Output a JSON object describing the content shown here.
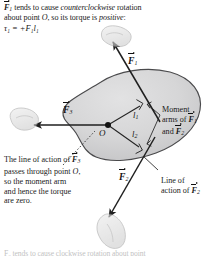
{
  "figure": {
    "caption_top": {
      "line1_a": "F",
      "line1_sub": "1",
      "line1_b": " tends to cause ",
      "line1_em": "counterclockwise",
      "line1_c": " rotation",
      "line2_a": "about point ",
      "line2_em": "O",
      "line2_b": ", so its torque is ",
      "line2_em2": "positive",
      "line2_c": ":",
      "equation": "τ₁ = +F₁l₁"
    },
    "caption_bottom_left": {
      "line1_a": "The line of action of ",
      "line1_vec": "F",
      "line1_sub": "3",
      "line2_a": "passes through point ",
      "line2_em": "O",
      "line2_b": ",",
      "line3": "so the moment arm",
      "line4": "and hence the torque",
      "line5": "are zero."
    },
    "callout_moment_arms": {
      "line1": "Moment",
      "line2_a": "arms of ",
      "line2_vec": "F",
      "line2_sub": "1",
      "line3_a": "and ",
      "line3_vec": "F",
      "line3_sub": "2"
    },
    "callout_line_of_action": {
      "line1": "Line of",
      "line2_a": "action of ",
      "line2_vec": "F",
      "line2_sub": "2"
    },
    "cut_off_caption": "F₂ tends to cause clockwise rotation about point",
    "vectors": [
      {
        "name": "F1",
        "label_base": "F",
        "label_sub": "1",
        "direction": "up-right"
      },
      {
        "name": "F2",
        "label_base": "F",
        "label_sub": "2",
        "direction": "down-left"
      },
      {
        "name": "F3",
        "label_base": "F",
        "label_sub": "3",
        "direction": "left"
      }
    ],
    "moment_arms": [
      {
        "name": "l1",
        "label_base": "l",
        "label_sub": "1"
      },
      {
        "name": "l2",
        "label_base": "l",
        "label_sub": "2"
      }
    ],
    "pivot": {
      "label": "O"
    },
    "colors": {
      "body_fill": "#d5d5d6",
      "body_stroke": "#4a4a4c",
      "vector_stroke": "#1f1f1f",
      "moment_arm_stroke": "#232323",
      "hand_fill": "#dedede",
      "hand_stroke": "#9a9a9a",
      "text": "#1a1a1a",
      "background": "#ffffff"
    }
  }
}
